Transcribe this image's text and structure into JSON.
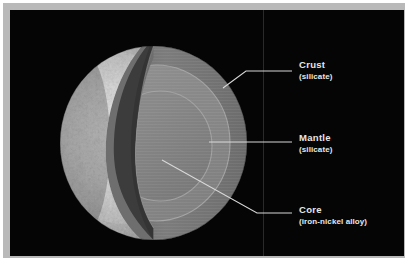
{
  "figure": {
    "background_color": "#050505",
    "frame_color": "#b9b9b9",
    "label_color": "#e8e8e8"
  },
  "planet": {
    "surface_label": "cratered-surface-crescent",
    "cut_wall_color": "#3e3e3e",
    "cut_face_color": "#7b7b7b",
    "mantle_color": "#8a8a8a",
    "core_color": "#828282"
  },
  "labels": {
    "crust": {
      "title": "Crust",
      "subtitle": "(silicate)"
    },
    "mantle": {
      "title": "Mantle",
      "subtitle": "(silicate)"
    },
    "core": {
      "title": "Core",
      "subtitle": "(iron-nickel alloy)"
    }
  }
}
